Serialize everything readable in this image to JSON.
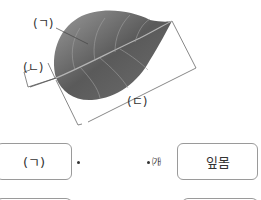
{
  "figure": {
    "labels": {
      "a": "(ㄱ)",
      "b": "(ㄴ)",
      "c": "(ㄷ)"
    },
    "colors": {
      "leaf_dark": "#4a4a4a",
      "leaf_light": "#8c8c8c",
      "vein": "#b5b5b5",
      "line": "#555555"
    }
  },
  "matching": {
    "left_items": [
      {
        "label": "(ㄱ)"
      }
    ],
    "right_items": [
      {
        "tag": "㈎",
        "label": "잎몸"
      }
    ]
  }
}
